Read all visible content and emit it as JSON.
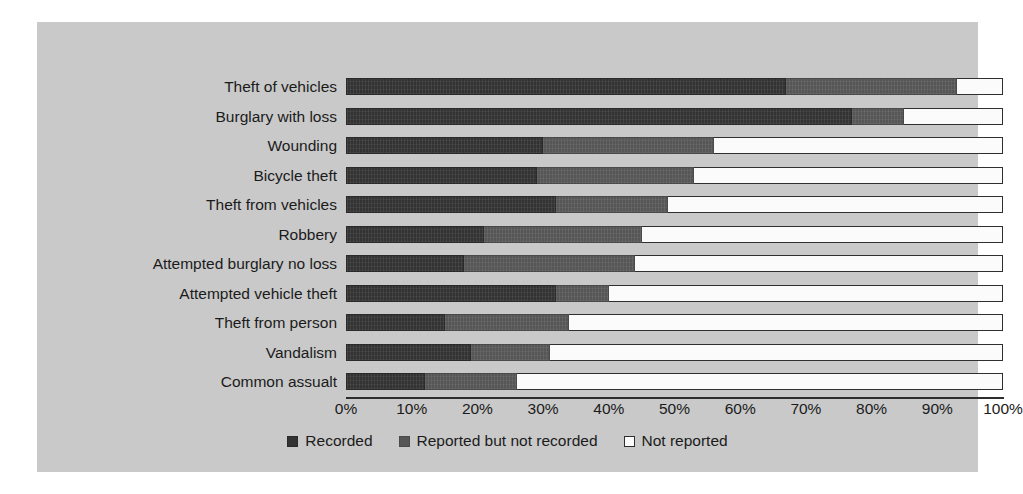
{
  "chart_data": {
    "type": "bar",
    "orientation": "horizontal",
    "stacked": true,
    "stacked_mode": "percent",
    "title": "",
    "subtitle": "",
    "xlabel": "",
    "ylabel": "",
    "xlim": [
      0,
      100
    ],
    "grid": false,
    "legend_position": "bottom",
    "categories": [
      "Theft of vehicles",
      "Burglary with loss",
      "Wounding",
      "Bicycle theft",
      "Theft from vehicles",
      "Robbery",
      "Attempted burglary no loss",
      "Attempted vehicle theft",
      "Theft from person",
      "Vandalism",
      "Common assualt"
    ],
    "tick_labels": [
      "0%",
      "10%",
      "20%",
      "30%",
      "40%",
      "50%",
      "60%",
      "70%",
      "80%",
      "90%",
      "100%"
    ],
    "tick_values": [
      0,
      10,
      20,
      30,
      40,
      50,
      60,
      70,
      80,
      90,
      100
    ],
    "series": [
      {
        "name": "Recorded",
        "color": "#333333",
        "values": [
          67,
          77,
          30,
          29,
          32,
          21,
          18,
          32,
          15,
          19,
          12
        ]
      },
      {
        "name": "Reported but not recorded",
        "color": "#565656",
        "values": [
          26,
          8,
          26,
          24,
          17,
          24,
          26,
          8,
          19,
          12,
          14
        ]
      },
      {
        "name": "Not reported",
        "color": "#fbfbfb",
        "values": [
          7,
          15,
          44,
          47,
          51,
          55,
          56,
          60,
          66,
          69,
          74
        ]
      }
    ]
  },
  "colors": {
    "page_background": "#ffffff",
    "panel_background": "#c9c9c9",
    "axis": "#2e2e2e",
    "text": "#1b1b1b"
  }
}
